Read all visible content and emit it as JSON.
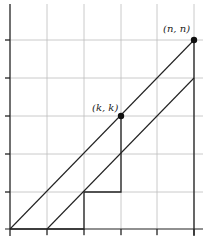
{
  "diagram": {
    "type": "lattice-path-grid",
    "grid": {
      "x_lines_px": [
        10,
        47,
        84,
        121,
        157,
        194
      ],
      "y_lines_px": [
        229,
        192,
        154,
        116,
        78,
        40
      ],
      "line_color": "#bbbbbb"
    },
    "points": [
      {
        "label": "(k,  k)",
        "x": 121,
        "y": 116
      },
      {
        "label": "(n,  n)",
        "x": 194,
        "y": 40
      }
    ],
    "diagonals": [
      {
        "from": [
          10,
          229
        ],
        "to": [
          194,
          40
        ]
      },
      {
        "from": [
          47,
          229
        ],
        "to": [
          194,
          78
        ]
      }
    ],
    "path": [
      [
        10,
        229
      ],
      [
        84,
        229
      ],
      [
        84,
        192
      ],
      [
        121,
        192
      ],
      [
        121,
        116
      ]
    ],
    "right_edge": {
      "from": [
        194,
        40
      ],
      "to": [
        194,
        229
      ]
    }
  }
}
